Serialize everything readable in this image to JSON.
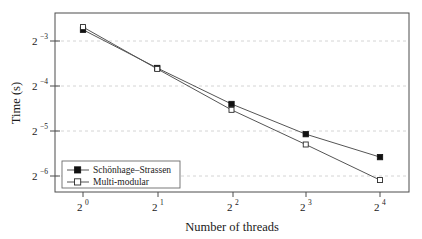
{
  "chart_data": {
    "type": "line",
    "title": "",
    "xlabel": "Number of threads",
    "ylabel": "Time (s)",
    "x_tick_labels": [
      "2^0",
      "2^1",
      "2^2",
      "2^3",
      "2^4"
    ],
    "x_tick_bases": [
      "2",
      "2",
      "2",
      "2",
      "2"
    ],
    "x_tick_exponents": [
      "0",
      "1",
      "2",
      "3",
      "4"
    ],
    "x": [
      1,
      2,
      4,
      8,
      16
    ],
    "x_log2": [
      0,
      1,
      2,
      3,
      4
    ],
    "y_tick_labels": [
      "2^-3",
      "2^-4",
      "2^-5",
      "2^-6"
    ],
    "y_tick_bases": [
      "2",
      "2",
      "2",
      "2"
    ],
    "y_tick_exponents": [
      "−3",
      "−4",
      "−5",
      "−6"
    ],
    "y_log2_ticks": [
      -3,
      -4,
      -5,
      -6
    ],
    "y_axis_scale": "log2",
    "ylim_log2": [
      -6.45,
      -2.42
    ],
    "xlim_log2": [
      -0.38,
      4.39
    ],
    "grid": true,
    "grid_axis": "y",
    "legend_position": "bottom-left-inside",
    "series": [
      {
        "name": "Schönhage–Strassen",
        "marker": "filled-square",
        "values_log2": [
          -2.75,
          -3.6,
          -4.4,
          -5.07,
          -5.58
        ],
        "values": [
          0.1487,
          0.0825,
          0.0474,
          0.0298,
          0.0209
        ]
      },
      {
        "name": "Multi-modular",
        "marker": "open-square",
        "values_log2": [
          -2.69,
          -3.62,
          -4.53,
          -5.3,
          -6.09
        ],
        "values": [
          0.155,
          0.0813,
          0.0433,
          0.0254,
          0.0147
        ]
      }
    ]
  },
  "axes": {
    "y_title": "Time (s)",
    "x_title": "Number of threads"
  },
  "legend": {
    "entries": [
      {
        "label": "Schönhage–Strassen",
        "marker": "filled-square"
      },
      {
        "label": "Multi-modular",
        "marker": "open-square"
      }
    ]
  },
  "colors": {
    "line": "#555555",
    "frame": "#4d4d4d",
    "grid": "#c9c9c9",
    "marker_fill": "#111111",
    "marker_open_fill": "#ffffff",
    "background": "#ffffff"
  }
}
